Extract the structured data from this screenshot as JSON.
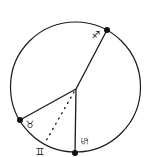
{
  "diagram": {
    "circle": {
      "cx": 75.5,
      "cy": 87,
      "r": 65
    },
    "center": {
      "x": 76,
      "y": 89
    },
    "points": [
      {
        "name": "sagittarius",
        "symbol": "♐",
        "x": 107,
        "y": 30,
        "label_x": 96,
        "label_y": 38,
        "rotate": 0
      },
      {
        "name": "taurus",
        "symbol": "♉",
        "x": 20,
        "y": 120,
        "label_x": 30,
        "label_y": 128,
        "rotate": 0
      },
      {
        "name": "cancer",
        "symbol": "♋",
        "x": 75,
        "y": 153,
        "label_x": 84,
        "label_y": 144,
        "rotate": 90
      }
    ],
    "dotted": {
      "name": "gemini",
      "symbol": "♊",
      "x": 46,
      "y": 141,
      "label_x": 40,
      "label_y": 155
    }
  }
}
